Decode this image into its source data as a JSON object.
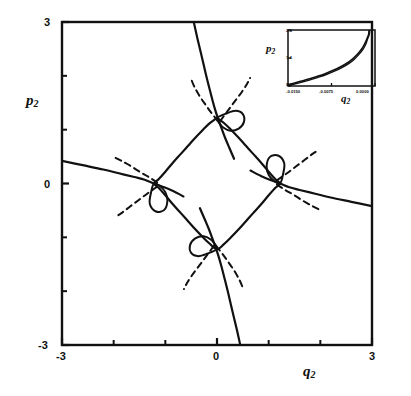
{
  "figure": {
    "title": "",
    "background_color": "#ffffff",
    "ink_color": "#111111"
  },
  "main_axes": {
    "xlabel": "q",
    "xlabel_sub": "2",
    "ylabel": "p",
    "ylabel_sub": "2",
    "xlim": [
      -3,
      3
    ],
    "ylim": [
      -3,
      3
    ],
    "x_tick_labels": [
      "-3",
      "0",
      "3"
    ],
    "x_tick_values": [
      -3,
      0,
      3
    ],
    "x_minor_ticks": [
      -2,
      -1,
      1,
      2
    ],
    "y_tick_labels": [
      "3",
      "0",
      "-3"
    ],
    "y_tick_values": [
      3,
      0,
      -3
    ],
    "y_minor_ticks": [
      2,
      1,
      -1,
      -2
    ],
    "frame": true,
    "grid": false
  },
  "inset_axes": {
    "xlabel": "q",
    "xlabel_sub": "2",
    "ylabel": "p",
    "ylabel_sub": "2",
    "xlim": [
      -0.015,
      0.0
    ],
    "ylim": [
      0.4,
      2.4
    ],
    "x_tick_labels": [
      "-0.0150",
      "-0.0075",
      "0.0000"
    ],
    "x_tick_values": [
      -0.015,
      -0.0075,
      0.0
    ],
    "y_tick_labels": [
      "2.4",
      "1.4",
      "0.4"
    ],
    "y_tick_values": [
      2.4,
      1.4,
      0.4
    ],
    "frame": true,
    "grid": false
  },
  "chart_data": {
    "type": "line",
    "title": "",
    "xlabel": "q_2",
    "ylabel": "p_2",
    "xlim": [
      -3,
      3
    ],
    "ylim": [
      -3,
      3
    ],
    "grid": false,
    "legend": "none",
    "series": [
      {
        "name": "solid-caustic-central-diamond",
        "style": "solid",
        "linewidth": 2.2,
        "points": [
          [
            0.0,
            1.22
          ],
          [
            0.14,
            1.12
          ],
          [
            0.28,
            0.99
          ],
          [
            0.42,
            0.85
          ],
          [
            0.56,
            0.7
          ],
          [
            0.7,
            0.55
          ],
          [
            0.85,
            0.39
          ],
          [
            1.0,
            0.22
          ],
          [
            1.13,
            0.08
          ],
          [
            1.22,
            0.0
          ],
          [
            1.13,
            -0.08
          ],
          [
            1.0,
            -0.22
          ],
          [
            0.85,
            -0.39
          ],
          [
            0.7,
            -0.55
          ],
          [
            0.56,
            -0.7
          ],
          [
            0.42,
            -0.85
          ],
          [
            0.28,
            -0.99
          ],
          [
            0.14,
            -1.12
          ],
          [
            0.0,
            -1.22
          ],
          [
            -0.14,
            -1.12
          ],
          [
            -0.28,
            -0.99
          ],
          [
            -0.42,
            -0.85
          ],
          [
            -0.56,
            -0.7
          ],
          [
            -0.7,
            -0.55
          ],
          [
            -0.85,
            -0.39
          ],
          [
            -1.0,
            -0.22
          ],
          [
            -1.13,
            -0.08
          ],
          [
            -1.22,
            0.0
          ],
          [
            -1.13,
            0.08
          ],
          [
            -1.0,
            0.22
          ],
          [
            -0.85,
            0.39
          ],
          [
            -0.7,
            0.55
          ],
          [
            -0.56,
            0.7
          ],
          [
            -0.42,
            0.85
          ],
          [
            -0.28,
            0.99
          ],
          [
            -0.14,
            1.12
          ],
          [
            0.0,
            1.22
          ]
        ]
      },
      {
        "name": "solid-branch-upper-steep",
        "style": "solid",
        "linewidth": 2.2,
        "points": [
          [
            -0.45,
            3.0
          ],
          [
            -0.38,
            2.7
          ],
          [
            -0.3,
            2.38
          ],
          [
            -0.22,
            2.05
          ],
          [
            -0.15,
            1.78
          ],
          [
            -0.08,
            1.52
          ],
          [
            -0.02,
            1.32
          ],
          [
            0.03,
            1.18
          ],
          [
            0.09,
            1.02
          ],
          [
            0.16,
            0.84
          ],
          [
            0.24,
            0.66
          ],
          [
            0.33,
            0.46
          ]
        ]
      },
      {
        "name": "solid-branch-lower-steep",
        "style": "solid",
        "linewidth": 2.2,
        "points": [
          [
            0.45,
            -3.0
          ],
          [
            0.38,
            -2.7
          ],
          [
            0.3,
            -2.38
          ],
          [
            0.22,
            -2.05
          ],
          [
            0.15,
            -1.78
          ],
          [
            0.08,
            -1.52
          ],
          [
            0.02,
            -1.32
          ],
          [
            -0.03,
            -1.18
          ],
          [
            -0.09,
            -1.02
          ],
          [
            -0.16,
            -0.84
          ],
          [
            -0.24,
            -0.66
          ],
          [
            -0.33,
            -0.46
          ]
        ]
      },
      {
        "name": "solid-branch-left-shallow",
        "style": "solid",
        "linewidth": 2.2,
        "points": [
          [
            -3.0,
            0.42
          ],
          [
            -2.6,
            0.34
          ],
          [
            -2.2,
            0.26
          ],
          [
            -1.9,
            0.19
          ],
          [
            -1.6,
            0.12
          ],
          [
            -1.4,
            0.07
          ],
          [
            -1.22,
            0.0
          ],
          [
            -1.05,
            -0.06
          ],
          [
            -0.85,
            -0.14
          ],
          [
            -0.65,
            -0.24
          ]
        ]
      },
      {
        "name": "solid-branch-right-shallow",
        "style": "solid",
        "linewidth": 2.2,
        "points": [
          [
            3.0,
            -0.42
          ],
          [
            2.6,
            -0.34
          ],
          [
            2.2,
            -0.26
          ],
          [
            1.9,
            -0.19
          ],
          [
            1.6,
            -0.12
          ],
          [
            1.4,
            -0.07
          ],
          [
            1.22,
            0.0
          ],
          [
            1.05,
            0.06
          ],
          [
            0.85,
            0.14
          ],
          [
            0.65,
            0.24
          ]
        ]
      },
      {
        "name": "solid-loop-top-cusp",
        "style": "solid",
        "linewidth": 2.0,
        "closed": true,
        "points": [
          [
            0.0,
            1.22
          ],
          [
            0.18,
            1.3
          ],
          [
            0.36,
            1.35
          ],
          [
            0.5,
            1.29
          ],
          [
            0.52,
            1.14
          ],
          [
            0.42,
            1.02
          ],
          [
            0.26,
            0.98
          ],
          [
            0.12,
            1.04
          ],
          [
            0.03,
            1.14
          ],
          [
            0.0,
            1.22
          ]
        ]
      },
      {
        "name": "solid-loop-bottom-cusp",
        "style": "solid",
        "linewidth": 2.0,
        "closed": true,
        "points": [
          [
            0.0,
            -1.22
          ],
          [
            -0.18,
            -1.3
          ],
          [
            -0.36,
            -1.35
          ],
          [
            -0.5,
            -1.29
          ],
          [
            -0.52,
            -1.14
          ],
          [
            -0.42,
            -1.02
          ],
          [
            -0.26,
            -0.98
          ],
          [
            -0.12,
            -1.04
          ],
          [
            -0.03,
            -1.14
          ],
          [
            0.0,
            -1.22
          ]
        ]
      },
      {
        "name": "solid-loop-left-cusp",
        "style": "solid",
        "linewidth": 2.0,
        "closed": true,
        "points": [
          [
            -1.22,
            0.0
          ],
          [
            -1.28,
            -0.18
          ],
          [
            -1.3,
            -0.38
          ],
          [
            -1.18,
            -0.52
          ],
          [
            -1.02,
            -0.49
          ],
          [
            -0.96,
            -0.32
          ],
          [
            -1.0,
            -0.16
          ],
          [
            -1.1,
            -0.05
          ],
          [
            -1.22,
            0.0
          ]
        ]
      },
      {
        "name": "solid-loop-right-cusp",
        "style": "solid",
        "linewidth": 2.0,
        "closed": true,
        "points": [
          [
            1.22,
            0.0
          ],
          [
            1.28,
            0.18
          ],
          [
            1.3,
            0.38
          ],
          [
            1.18,
            0.52
          ],
          [
            1.02,
            0.49
          ],
          [
            0.96,
            0.32
          ],
          [
            1.0,
            0.16
          ],
          [
            1.1,
            0.05
          ],
          [
            1.22,
            0.0
          ]
        ]
      },
      {
        "name": "dashed-top-cusp-left-arm",
        "style": "dashed",
        "linewidth": 2.0,
        "points": [
          [
            0.02,
            1.16
          ],
          [
            -0.1,
            1.3
          ],
          [
            -0.22,
            1.46
          ],
          [
            -0.34,
            1.63
          ],
          [
            -0.44,
            1.8
          ],
          [
            -0.5,
            1.94
          ]
        ]
      },
      {
        "name": "dashed-top-cusp-right-arm",
        "style": "dashed",
        "linewidth": 2.0,
        "points": [
          [
            0.06,
            1.16
          ],
          [
            0.2,
            1.34
          ],
          [
            0.34,
            1.52
          ],
          [
            0.48,
            1.7
          ],
          [
            0.58,
            1.85
          ],
          [
            0.64,
            1.96
          ]
        ]
      },
      {
        "name": "dashed-bottom-cusp-right-arm",
        "style": "dashed",
        "linewidth": 2.0,
        "points": [
          [
            -0.02,
            -1.16
          ],
          [
            0.1,
            -1.3
          ],
          [
            0.22,
            -1.46
          ],
          [
            0.34,
            -1.63
          ],
          [
            0.44,
            -1.8
          ],
          [
            0.5,
            -1.94
          ]
        ]
      },
      {
        "name": "dashed-bottom-cusp-left-arm",
        "style": "dashed",
        "linewidth": 2.0,
        "points": [
          [
            -0.06,
            -1.16
          ],
          [
            -0.2,
            -1.34
          ],
          [
            -0.34,
            -1.52
          ],
          [
            -0.48,
            -1.7
          ],
          [
            -0.58,
            -1.85
          ],
          [
            -0.64,
            -1.96
          ]
        ]
      },
      {
        "name": "dashed-left-cusp-upper-arm",
        "style": "dashed",
        "linewidth": 2.0,
        "points": [
          [
            -1.16,
            0.02
          ],
          [
            -1.32,
            0.12
          ],
          [
            -1.5,
            0.22
          ],
          [
            -1.68,
            0.33
          ],
          [
            -1.85,
            0.42
          ],
          [
            -1.97,
            0.48
          ]
        ]
      },
      {
        "name": "dashed-left-cusp-lower-arm",
        "style": "dashed",
        "linewidth": 2.0,
        "points": [
          [
            -1.16,
            -0.06
          ],
          [
            -1.34,
            -0.18
          ],
          [
            -1.52,
            -0.31
          ],
          [
            -1.7,
            -0.44
          ],
          [
            -1.85,
            -0.55
          ],
          [
            -1.96,
            -0.62
          ]
        ]
      },
      {
        "name": "dashed-right-cusp-lower-arm",
        "style": "dashed",
        "linewidth": 2.0,
        "points": [
          [
            1.16,
            -0.02
          ],
          [
            1.32,
            -0.12
          ],
          [
            1.5,
            -0.22
          ],
          [
            1.68,
            -0.33
          ],
          [
            1.85,
            -0.42
          ],
          [
            1.97,
            -0.48
          ]
        ]
      },
      {
        "name": "dashed-right-cusp-upper-arm",
        "style": "dashed",
        "linewidth": 2.0,
        "points": [
          [
            1.16,
            0.06
          ],
          [
            1.34,
            0.18
          ],
          [
            1.52,
            0.31
          ],
          [
            1.7,
            0.44
          ],
          [
            1.85,
            0.55
          ],
          [
            1.96,
            0.62
          ]
        ]
      }
    ],
    "inset": {
      "type": "line",
      "xlabel": "q_2",
      "ylabel": "p_2",
      "xlim": [
        -0.015,
        0.0
      ],
      "ylim": [
        0.4,
        2.4
      ],
      "series": [
        {
          "name": "inset-asymptotic-curve-outer",
          "style": "solid",
          "linewidth": 1.6,
          "points": [
            [
              -0.015,
              0.45
            ],
            [
              -0.014,
              0.5
            ],
            [
              -0.0128,
              0.57
            ],
            [
              -0.0114,
              0.65
            ],
            [
              -0.01,
              0.74
            ],
            [
              -0.0086,
              0.84
            ],
            [
              -0.0072,
              0.96
            ],
            [
              -0.006,
              1.08
            ],
            [
              -0.0048,
              1.22
            ],
            [
              -0.0038,
              1.38
            ],
            [
              -0.003,
              1.54
            ],
            [
              -0.0023,
              1.72
            ],
            [
              -0.0018,
              1.9
            ],
            [
              -0.0014,
              2.08
            ],
            [
              -0.0011,
              2.24
            ],
            [
              -0.001,
              2.38
            ]
          ]
        },
        {
          "name": "inset-asymptotic-curve-inner",
          "style": "solid",
          "linewidth": 1.4,
          "points": [
            [
              -0.015,
              0.42
            ],
            [
              -0.0139,
              0.47
            ],
            [
              -0.0126,
              0.54
            ],
            [
              -0.0112,
              0.62
            ],
            [
              -0.0098,
              0.71
            ],
            [
              -0.0084,
              0.81
            ],
            [
              -0.007,
              0.93
            ],
            [
              -0.0058,
              1.05
            ],
            [
              -0.0046,
              1.19
            ],
            [
              -0.0036,
              1.35
            ],
            [
              -0.0028,
              1.52
            ],
            [
              -0.0021,
              1.7
            ],
            [
              -0.0016,
              1.89
            ],
            [
              -0.0013,
              2.07
            ],
            [
              -0.001,
              2.24
            ],
            [
              -0.0009,
              2.38
            ]
          ]
        }
      ]
    }
  }
}
